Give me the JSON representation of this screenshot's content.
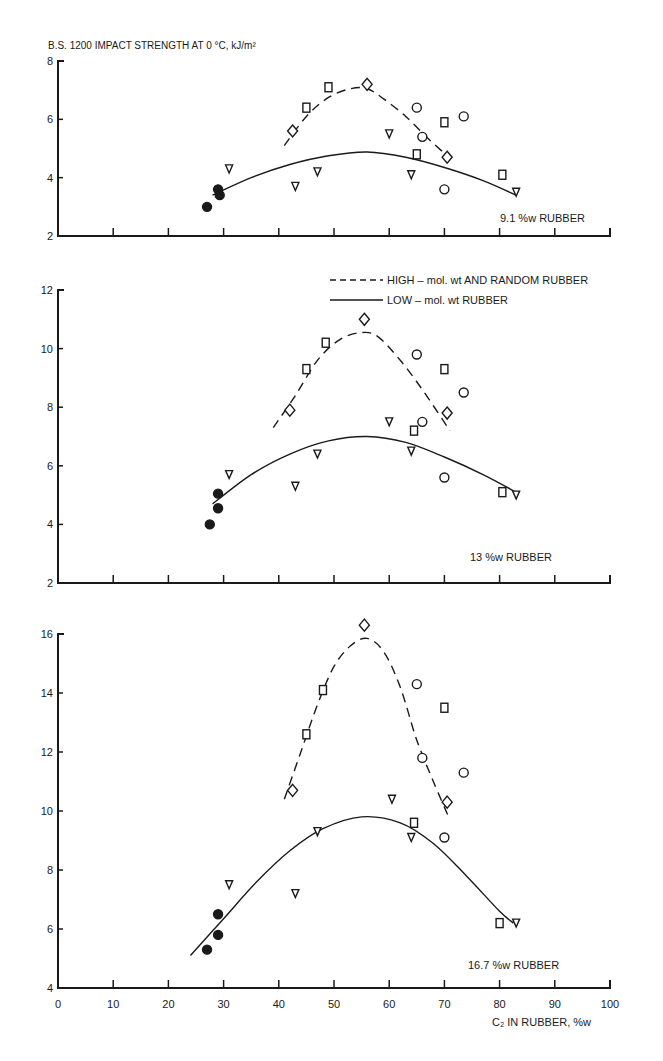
{
  "chart_data": {
    "type": "scatter",
    "title": "B.S. 1200 IMPACT STRENGTH AT 0 °C, kJ/m²",
    "xlabel": "C₂ IN RUBBER, %w",
    "ylabel": "B.S. 1200 IMPACT STRENGTH AT 0 °C, kJ/m²",
    "xlim": [
      0,
      100
    ],
    "x_ticks": [
      0,
      10,
      20,
      30,
      40,
      50,
      60,
      70,
      80,
      90,
      100
    ],
    "legend": {
      "position": "upper right of middle panel",
      "entries": [
        {
          "style": "dashed",
          "label": "HIGH – mol. wt AND RANDOM RUBBER"
        },
        {
          "style": "solid",
          "label": "LOW – mol. wt RUBBER"
        }
      ]
    },
    "marker_types": [
      "filled-circle",
      "triangle-down",
      "square",
      "diamond",
      "circle"
    ],
    "panels": [
      {
        "label": "9.1 %w RUBBER",
        "ylim": [
          2,
          8
        ],
        "y_ticks": [
          2,
          4,
          6,
          8
        ],
        "points": [
          {
            "marker": "filled-circle",
            "x": 27,
            "y": 3.0
          },
          {
            "marker": "filled-circle",
            "x": 29,
            "y": 3.6
          },
          {
            "marker": "filled-circle",
            "x": 29.3,
            "y": 3.4
          },
          {
            "marker": "triangle-down",
            "x": 31,
            "y": 4.3
          },
          {
            "marker": "triangle-down",
            "x": 43,
            "y": 3.7
          },
          {
            "marker": "triangle-down",
            "x": 47,
            "y": 4.2
          },
          {
            "marker": "triangle-down",
            "x": 60,
            "y": 5.5
          },
          {
            "marker": "triangle-down",
            "x": 64,
            "y": 4.1
          },
          {
            "marker": "triangle-down",
            "x": 83,
            "y": 3.5
          },
          {
            "marker": "square",
            "x": 45,
            "y": 6.4
          },
          {
            "marker": "square",
            "x": 49,
            "y": 7.1
          },
          {
            "marker": "square",
            "x": 65,
            "y": 4.8
          },
          {
            "marker": "square",
            "x": 70,
            "y": 5.9
          },
          {
            "marker": "square",
            "x": 80.5,
            "y": 4.1
          },
          {
            "marker": "diamond",
            "x": 42.5,
            "y": 5.6
          },
          {
            "marker": "diamond",
            "x": 56,
            "y": 7.2
          },
          {
            "marker": "diamond",
            "x": 70.5,
            "y": 4.7
          },
          {
            "marker": "circle",
            "x": 65,
            "y": 6.4
          },
          {
            "marker": "circle",
            "x": 66,
            "y": 5.4
          },
          {
            "marker": "circle",
            "x": 70,
            "y": 3.6
          },
          {
            "marker": "circle",
            "x": 73.5,
            "y": 6.1
          }
        ],
        "curves": {
          "low": {
            "x": [
              28,
              35,
              42,
              49,
              56,
              63,
              70,
              77,
              83
            ],
            "y": [
              3.4,
              4.0,
              4.45,
              4.75,
              4.88,
              4.7,
              4.35,
              3.9,
              3.4
            ]
          },
          "high": {
            "x": [
              41,
              45,
              49,
              53,
              56,
              59,
              63,
              67,
              70.5
            ],
            "y": [
              5.1,
              6.1,
              6.75,
              7.05,
              7.05,
              6.7,
              6.1,
              5.35,
              4.75
            ]
          }
        }
      },
      {
        "label": "13 %w RUBBER",
        "ylim": [
          2,
          12
        ],
        "y_ticks": [
          2,
          4,
          6,
          8,
          10,
          12
        ],
        "points": [
          {
            "marker": "filled-circle",
            "x": 27.5,
            "y": 4.0
          },
          {
            "marker": "filled-circle",
            "x": 29,
            "y": 4.55
          },
          {
            "marker": "filled-circle",
            "x": 29,
            "y": 5.05
          },
          {
            "marker": "triangle-down",
            "x": 31,
            "y": 5.7
          },
          {
            "marker": "triangle-down",
            "x": 43,
            "y": 5.3
          },
          {
            "marker": "triangle-down",
            "x": 47,
            "y": 6.4
          },
          {
            "marker": "triangle-down",
            "x": 60,
            "y": 7.5
          },
          {
            "marker": "triangle-down",
            "x": 64,
            "y": 6.5
          },
          {
            "marker": "triangle-down",
            "x": 83,
            "y": 5.0
          },
          {
            "marker": "square",
            "x": 45,
            "y": 9.3
          },
          {
            "marker": "square",
            "x": 48.5,
            "y": 10.2
          },
          {
            "marker": "square",
            "x": 64.5,
            "y": 7.2
          },
          {
            "marker": "square",
            "x": 70,
            "y": 9.3
          },
          {
            "marker": "square",
            "x": 80.5,
            "y": 5.1
          },
          {
            "marker": "diamond",
            "x": 42,
            "y": 7.9
          },
          {
            "marker": "diamond",
            "x": 55.5,
            "y": 11.0
          },
          {
            "marker": "diamond",
            "x": 70.5,
            "y": 7.8
          },
          {
            "marker": "circle",
            "x": 65,
            "y": 9.8
          },
          {
            "marker": "circle",
            "x": 66,
            "y": 7.5
          },
          {
            "marker": "circle",
            "x": 70,
            "y": 5.6
          },
          {
            "marker": "circle",
            "x": 73.5,
            "y": 8.5
          }
        ],
        "curves": {
          "low": {
            "x": [
              28,
              35,
              42,
              49,
              56,
              63,
              70,
              77,
              83
            ],
            "y": [
              4.7,
              5.7,
              6.4,
              6.85,
              7.0,
              6.8,
              6.3,
              5.7,
              5.1
            ]
          },
          "high": {
            "x": [
              39,
              43,
              47,
              51,
              55,
              58,
              62,
              66,
              71
            ],
            "y": [
              7.3,
              8.4,
              9.6,
              10.3,
              10.55,
              10.4,
              9.6,
              8.6,
              7.2
            ]
          }
        }
      },
      {
        "label": "16.7 %w RUBBER",
        "ylim": [
          4,
          16
        ],
        "y_ticks": [
          4,
          6,
          8,
          10,
          12,
          14,
          16
        ],
        "points": [
          {
            "marker": "filled-circle",
            "x": 27,
            "y": 5.3
          },
          {
            "marker": "filled-circle",
            "x": 29,
            "y": 5.8
          },
          {
            "marker": "filled-circle",
            "x": 29,
            "y": 6.5
          },
          {
            "marker": "triangle-down",
            "x": 31,
            "y": 7.5
          },
          {
            "marker": "triangle-down",
            "x": 43,
            "y": 7.2
          },
          {
            "marker": "triangle-down",
            "x": 47,
            "y": 9.3
          },
          {
            "marker": "triangle-down",
            "x": 60.5,
            "y": 10.4
          },
          {
            "marker": "triangle-down",
            "x": 64,
            "y": 9.1
          },
          {
            "marker": "triangle-down",
            "x": 83,
            "y": 6.2
          },
          {
            "marker": "square",
            "x": 45,
            "y": 12.6
          },
          {
            "marker": "square",
            "x": 48,
            "y": 14.1
          },
          {
            "marker": "square",
            "x": 64.5,
            "y": 9.6
          },
          {
            "marker": "square",
            "x": 70,
            "y": 13.5
          },
          {
            "marker": "square",
            "x": 80,
            "y": 6.2
          },
          {
            "marker": "diamond",
            "x": 42.5,
            "y": 10.7
          },
          {
            "marker": "diamond",
            "x": 55.5,
            "y": 16.3
          },
          {
            "marker": "diamond",
            "x": 70.5,
            "y": 10.3
          },
          {
            "marker": "circle",
            "x": 65,
            "y": 14.3
          },
          {
            "marker": "circle",
            "x": 66,
            "y": 11.8
          },
          {
            "marker": "circle",
            "x": 70,
            "y": 9.1
          },
          {
            "marker": "circle",
            "x": 73.5,
            "y": 11.3
          }
        ],
        "curves": {
          "low": {
            "x": [
              24,
              30,
              36,
              42,
              48,
              55,
              62,
              68,
              74,
              80,
              82.5
            ],
            "y": [
              5.1,
              6.35,
              7.6,
              8.65,
              9.4,
              9.8,
              9.6,
              8.9,
              7.8,
              6.6,
              6.2
            ]
          },
          "high": {
            "x": [
              41,
              44,
              47,
              50,
              53,
              56,
              59,
              62,
              65,
              68,
              71
            ],
            "y": [
              10.4,
              12.0,
              13.6,
              14.9,
              15.6,
              15.85,
              15.4,
              14.2,
              12.4,
              11.0,
              9.7
            ]
          }
        }
      }
    ]
  },
  "labels": {
    "y_title": "B.S. 1200 IMPACT STRENGTH AT 0 °C, kJ/m²",
    "x_title": "C₂ IN RUBBER, %w",
    "legend_high": "HIGH – mol. wt AND RANDOM RUBBER",
    "legend_low": "LOW – mol. wt RUBBER",
    "panel_top": "9.1 %w RUBBER",
    "panel_mid": "13 %w RUBBER",
    "panel_bot": "16.7 %w RUBBER"
  }
}
